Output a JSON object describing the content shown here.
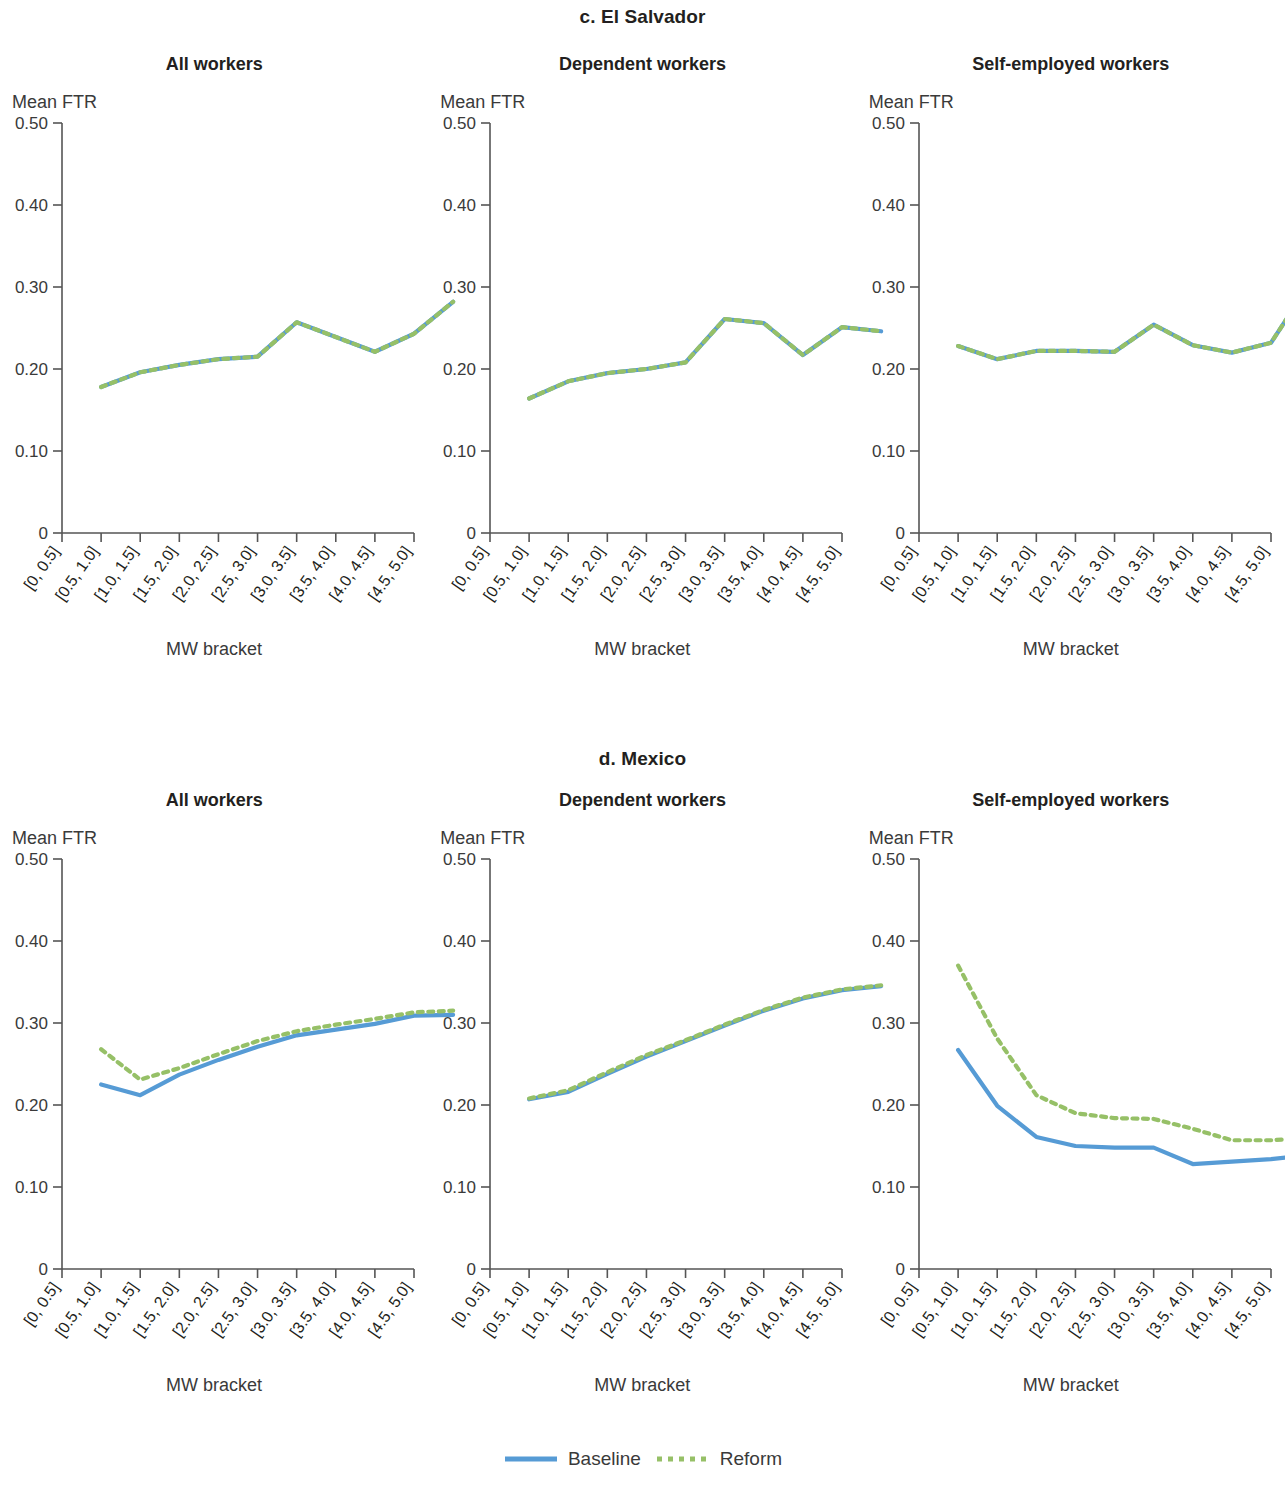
{
  "figure": {
    "series_names": [
      "Baseline",
      "Reform"
    ],
    "baseline_color": "#569BD5",
    "reform_color": "#96C067",
    "y_axis_title": "Mean FTR",
    "x_axis_title": "MW bracket",
    "y_ticks": [
      "0",
      "0.10",
      "0.20",
      "0.30",
      "0.40",
      "0.50"
    ],
    "x_tick_labels": [
      "[0, 0.5]",
      "[0.5, 1.0]",
      "[1.0, 1.5]",
      "[1.5, 2.0]",
      "[2.0, 2.5]",
      "[2.5, 3.0]",
      "[3.0, 3.5]",
      "[3.5, 4.0]",
      "[4.0, 4.5]",
      "[4.5, 5.0]"
    ]
  },
  "legend": {
    "baseline_label": "Baseline",
    "reform_label": "Reform"
  },
  "sections": [
    {
      "id": "el-salvador",
      "title": "c. El Salvador",
      "subtitles": [
        "All workers",
        "Dependent workers",
        "Self-employed workers"
      ]
    },
    {
      "id": "mexico",
      "title": "d. Mexico",
      "subtitles": [
        "All workers",
        "Dependent workers",
        "Self-employed workers"
      ]
    }
  ],
  "chart_data": [
    {
      "id": "el-salvador-all-workers",
      "type": "line",
      "title": "All workers",
      "panel": "c. El Salvador",
      "xlabel": "MW bracket",
      "ylabel": "Mean FTR",
      "ylim": [
        0,
        0.5
      ],
      "yticks": [
        0,
        0.1,
        0.2,
        0.3,
        0.4,
        0.5
      ],
      "grid": false,
      "legend_position": "bottom-figure",
      "categories": [
        "[0, 0.5]",
        "[0.5, 1.0]",
        "[1.0, 1.5]",
        "[1.5, 2.0]",
        "[2.0, 2.5]",
        "[2.5, 3.0]",
        "[3.0, 3.5]",
        "[3.5, 4.0]",
        "[4.0, 4.5]",
        "[4.5, 5.0]"
      ],
      "series": [
        {
          "name": "Baseline",
          "values": [
            null,
            0.178,
            0.196,
            0.205,
            0.212,
            0.215,
            0.257,
            0.239,
            0.221,
            0.243,
            0.282
          ]
        },
        {
          "name": "Reform",
          "values": [
            null,
            0.178,
            0.196,
            0.205,
            0.212,
            0.215,
            0.257,
            0.239,
            0.221,
            0.243,
            0.282
          ]
        }
      ]
    },
    {
      "id": "el-salvador-dependent-workers",
      "type": "line",
      "title": "Dependent workers",
      "panel": "c. El Salvador",
      "xlabel": "MW bracket",
      "ylabel": "Mean FTR",
      "ylim": [
        0,
        0.5
      ],
      "yticks": [
        0,
        0.1,
        0.2,
        0.3,
        0.4,
        0.5
      ],
      "grid": false,
      "categories": [
        "[0, 0.5]",
        "[0.5, 1.0]",
        "[1.0, 1.5]",
        "[1.5, 2.0]",
        "[2.0, 2.5]",
        "[2.5, 3.0]",
        "[3.0, 3.5]",
        "[3.5, 4.0]",
        "[4.0, 4.5]",
        "[4.5, 5.0]"
      ],
      "series": [
        {
          "name": "Baseline",
          "values": [
            null,
            0.164,
            0.185,
            0.195,
            0.2,
            0.208,
            0.261,
            0.256,
            0.217,
            0.251,
            0.246
          ]
        },
        {
          "name": "Reform",
          "values": [
            null,
            0.164,
            0.185,
            0.195,
            0.2,
            0.208,
            0.261,
            0.256,
            0.217,
            0.251,
            0.246
          ]
        }
      ]
    },
    {
      "id": "el-salvador-self-employed-workers",
      "type": "line",
      "title": "Self-employed workers",
      "panel": "c. El Salvador",
      "xlabel": "MW bracket",
      "ylabel": "Mean FTR",
      "ylim": [
        0,
        0.5
      ],
      "yticks": [
        0,
        0.1,
        0.2,
        0.3,
        0.4,
        0.5
      ],
      "grid": false,
      "categories": [
        "[0, 0.5]",
        "[0.5, 1.0]",
        "[1.0, 1.5]",
        "[1.5, 2.0]",
        "[2.0, 2.5]",
        "[2.5, 3.0]",
        "[3.0, 3.5]",
        "[3.5, 4.0]",
        "[4.0, 4.5]",
        "[4.5, 5.0]"
      ],
      "series": [
        {
          "name": "Baseline",
          "values": [
            null,
            0.228,
            0.212,
            0.222,
            0.222,
            0.221,
            0.254,
            0.229,
            0.22,
            0.232,
            0.305
          ]
        },
        {
          "name": "Reform",
          "values": [
            null,
            0.228,
            0.212,
            0.222,
            0.222,
            0.221,
            0.254,
            0.229,
            0.22,
            0.232,
            0.305
          ]
        }
      ]
    },
    {
      "id": "mexico-all-workers",
      "type": "line",
      "title": "All workers",
      "panel": "d. Mexico",
      "xlabel": "MW bracket",
      "ylabel": "Mean FTR",
      "ylim": [
        0,
        0.5
      ],
      "yticks": [
        0,
        0.1,
        0.2,
        0.3,
        0.4,
        0.5
      ],
      "grid": false,
      "categories": [
        "[0, 0.5]",
        "[0.5, 1.0]",
        "[1.0, 1.5]",
        "[1.5, 2.0]",
        "[2.0, 2.5]",
        "[2.5, 3.0]",
        "[3.0, 3.5]",
        "[3.5, 4.0]",
        "[4.0, 4.5]",
        "[4.5, 5.0]"
      ],
      "series": [
        {
          "name": "Baseline",
          "values": [
            null,
            0.225,
            0.212,
            0.237,
            0.255,
            0.271,
            0.285,
            0.292,
            0.299,
            0.309,
            0.31
          ]
        },
        {
          "name": "Reform",
          "values": [
            null,
            0.268,
            0.231,
            0.245,
            0.262,
            0.278,
            0.29,
            0.298,
            0.305,
            0.313,
            0.315
          ]
        }
      ]
    },
    {
      "id": "mexico-dependent-workers",
      "type": "line",
      "title": "Dependent workers",
      "panel": "d. Mexico",
      "xlabel": "MW bracket",
      "ylabel": "Mean FTR",
      "ylim": [
        0,
        0.5
      ],
      "yticks": [
        0,
        0.1,
        0.2,
        0.3,
        0.4,
        0.5
      ],
      "grid": false,
      "categories": [
        "[0, 0.5]",
        "[0.5, 1.0]",
        "[1.0, 1.5]",
        "[1.5, 2.0]",
        "[2.0, 2.5]",
        "[2.5, 3.0]",
        "[3.0, 3.5]",
        "[3.5, 4.0]",
        "[4.0, 4.5]",
        "[4.5, 5.0]"
      ],
      "series": [
        {
          "name": "Baseline",
          "values": [
            null,
            0.207,
            0.216,
            0.238,
            0.259,
            0.278,
            0.297,
            0.315,
            0.33,
            0.34,
            0.345
          ]
        },
        {
          "name": "Reform",
          "values": [
            null,
            0.208,
            0.218,
            0.24,
            0.261,
            0.279,
            0.298,
            0.316,
            0.331,
            0.341,
            0.346
          ]
        }
      ]
    },
    {
      "id": "mexico-self-employed-workers",
      "type": "line",
      "title": "Self-employed workers",
      "panel": "d. Mexico",
      "xlabel": "MW bracket",
      "ylabel": "Mean FTR",
      "ylim": [
        0,
        0.5
      ],
      "yticks": [
        0,
        0.1,
        0.2,
        0.3,
        0.4,
        0.5
      ],
      "grid": false,
      "categories": [
        "[0, 0.5]",
        "[0.5, 1.0]",
        "[1.0, 1.5]",
        "[1.5, 2.0]",
        "[2.0, 2.5]",
        "[2.5, 3.0]",
        "[3.0, 3.5]",
        "[3.5, 4.0]",
        "[4.0, 4.5]",
        "[4.5, 5.0]"
      ],
      "series": [
        {
          "name": "Baseline",
          "values": [
            null,
            0.267,
            0.199,
            0.161,
            0.15,
            0.148,
            0.148,
            0.128,
            0.131,
            0.134,
            0.139
          ]
        },
        {
          "name": "Reform",
          "values": [
            null,
            0.37,
            0.281,
            0.212,
            0.19,
            0.184,
            0.183,
            0.171,
            0.157,
            0.157,
            0.16
          ]
        }
      ]
    }
  ]
}
